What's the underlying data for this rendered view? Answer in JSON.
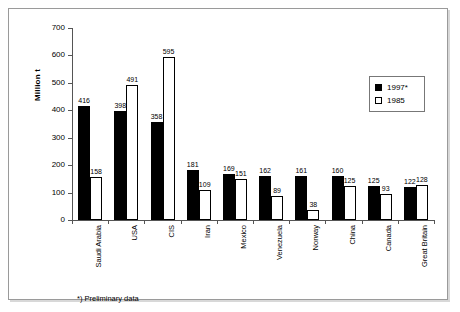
{
  "chart_data": {
    "type": "bar",
    "title": "",
    "xlabel": "",
    "ylabel": "Million t",
    "ylim": [
      0,
      700
    ],
    "yticks": [
      0,
      100,
      200,
      300,
      400,
      500,
      600,
      700
    ],
    "grid": false,
    "legend_position": "top-right",
    "categories": [
      "Saudi Arabia",
      "USA",
      "CIS",
      "Iran",
      "Mexico",
      "Venezuela",
      "Norway",
      "China",
      "Canada",
      "Great Britain"
    ],
    "series": [
      {
        "name": "1997*",
        "color": "#000000",
        "style": "filled",
        "values": [
          416,
          398,
          358,
          181,
          169,
          162,
          161,
          160,
          125,
          122
        ]
      },
      {
        "name": "1985",
        "color": "#ffffff",
        "style": "hollow",
        "values": [
          158,
          491,
          595,
          109,
          151,
          89,
          38,
          125,
          93,
          128
        ]
      }
    ],
    "annotations": [
      "*) Preliminary data"
    ]
  },
  "legend": {
    "items": [
      {
        "label": "1997*",
        "swatch": "filled"
      },
      {
        "label": "1985",
        "swatch": "hollow"
      }
    ]
  },
  "footnote": {
    "text": "*) Preliminary data"
  },
  "axis": {
    "y_title": "Million t"
  }
}
